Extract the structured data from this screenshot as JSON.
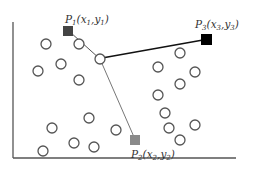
{
  "diagram": {
    "points": [
      {
        "id": "P1",
        "label": "P",
        "sub": "1",
        "coords": "(x",
        "xsub": "1",
        "sep": ",y",
        "ysub": "1",
        "close": ")",
        "color": "#444444"
      },
      {
        "id": "P2",
        "label": "P",
        "sub": "2",
        "coords": "(x",
        "xsub": "2",
        "sep": ",y",
        "ysub": "2",
        "close": ")",
        "color": "#8a8a8a"
      },
      {
        "id": "P3",
        "label": "P",
        "sub": "3",
        "coords": "(x",
        "xsub": "3",
        "sep": ",y",
        "ysub": "3",
        "close": ")",
        "color": "#000000"
      }
    ],
    "connections": [
      {
        "from": "hub",
        "to": "P1",
        "color": "#555555"
      },
      {
        "from": "hub",
        "to": "P2",
        "color": "#777777"
      },
      {
        "from": "hub",
        "to": "P3",
        "color": "#111111"
      }
    ],
    "circle_count": 21,
    "circle_stroke": "#555555",
    "axis_color": "#555555"
  }
}
